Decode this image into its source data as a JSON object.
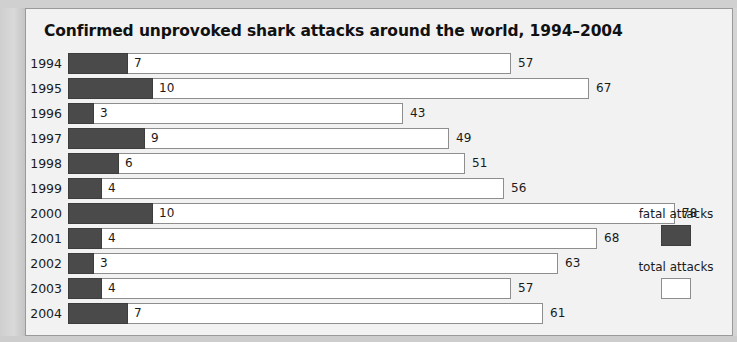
{
  "chart_data": {
    "type": "bar",
    "title": "Confirmed unprovoked shark attacks around the world, 1994–2004",
    "xlabel": "",
    "ylabel": "",
    "orientation": "horizontal",
    "grid": false,
    "legend_position": "right",
    "categories": [
      "1994",
      "1995",
      "1996",
      "1997",
      "1998",
      "1999",
      "2000",
      "2001",
      "2002",
      "2003",
      "2004"
    ],
    "series": [
      {
        "name": "fatal attacks",
        "color": "#4a4a4a",
        "values": [
          7,
          10,
          3,
          9,
          6,
          4,
          10,
          4,
          3,
          4,
          7
        ]
      },
      {
        "name": "total attacks",
        "color": "#ffffff",
        "values": [
          57,
          67,
          43,
          49,
          51,
          56,
          78,
          68,
          63,
          57,
          61
        ]
      }
    ],
    "xlim": [
      0,
      80
    ]
  },
  "legend": {
    "fatal_label": "fatal attacks",
    "total_label": "total attacks"
  },
  "colors": {
    "fatal": "#4a4a4a",
    "total": "#ffffff",
    "panel_background": "#f2f2f2",
    "page_background": "#d4d4d4",
    "border": "#9a9a9a",
    "text": "#1a1a1a"
  }
}
